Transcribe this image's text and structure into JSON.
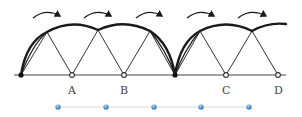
{
  "diagram": {
    "type": "rolling-arcs",
    "baseline_y": 75,
    "points": [
      {
        "id": "P0",
        "label": "",
        "x": 21,
        "style": "filled"
      },
      {
        "id": "A",
        "label": "A",
        "x": 72,
        "style": "hollow"
      },
      {
        "id": "B",
        "label": "B",
        "x": 124,
        "style": "hollow"
      },
      {
        "id": "P3",
        "label": "",
        "x": 175,
        "style": "filled"
      },
      {
        "id": "C",
        "label": "C",
        "x": 226,
        "style": "hollow"
      },
      {
        "id": "D",
        "label": "D",
        "x": 278,
        "style": "hollow"
      }
    ],
    "labels": {
      "A": "A",
      "B": "B",
      "C": "C",
      "D": "D"
    },
    "arrow_count": 5,
    "arrow_direction": "clockwise",
    "timeline_dots": 5,
    "colors": {
      "line": "#2b2b2b",
      "thick_arc": "#1a1a1a",
      "dot_blue": "#4a90d9",
      "timeline": "#c8d8e8",
      "label": "#444444"
    }
  }
}
